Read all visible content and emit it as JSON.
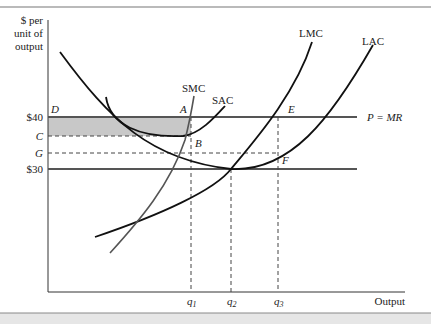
{
  "figure": {
    "y_axis_label": [
      "$ per",
      "unit of",
      "output"
    ],
    "x_axis_label": "Output",
    "price_labels": {
      "p40": "$40",
      "c": "C",
      "g": "G",
      "p30": "$30"
    },
    "point_labels": {
      "d": "D",
      "a": "A",
      "b": "B",
      "e": "E",
      "f": "F"
    },
    "curve_labels": {
      "smc": "SMC",
      "sac": "SAC",
      "lmc": "LMC",
      "lac": "LAC"
    },
    "line_labels": {
      "p_mr": "P = MR"
    },
    "quantity_labels": {
      "q1": "q",
      "q1_sub": "1",
      "q2": "q",
      "q2_sub": "2",
      "q3": "q",
      "q3_sub": "3"
    },
    "colors": {
      "axis": "#333333",
      "price_line": "#555555",
      "curve": "#111111",
      "smc_curve": "#555555",
      "shaded_area": "#c8c8c8",
      "footer_band": "#e6e6e6"
    }
  }
}
